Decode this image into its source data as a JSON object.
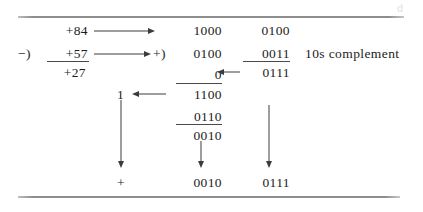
{
  "figure": {
    "watermark": "d"
  },
  "decimal_block": {
    "minuend": "+84",
    "operator": "−)",
    "subtrahend": "+57",
    "result": "+27"
  },
  "binary_block": {
    "plus_operator": "+)",
    "row1_mid": "1000",
    "row1_right": "0100",
    "row2_mid": "0100",
    "row2_right": "0011",
    "row3_mid": "0",
    "row3_right": "0111",
    "row4_left": "1",
    "row4_mid": "1100",
    "row5_mid": "0110",
    "row6_mid": "0010"
  },
  "result_row": {
    "sign": "+",
    "mid": "0010",
    "right": "0111"
  },
  "annotation": {
    "label": "10s complement"
  },
  "colors": {
    "text": "#1c1c1c",
    "rule": "#8d8d8d",
    "arrow": "#3c3c3c",
    "background": "#ffffff"
  }
}
